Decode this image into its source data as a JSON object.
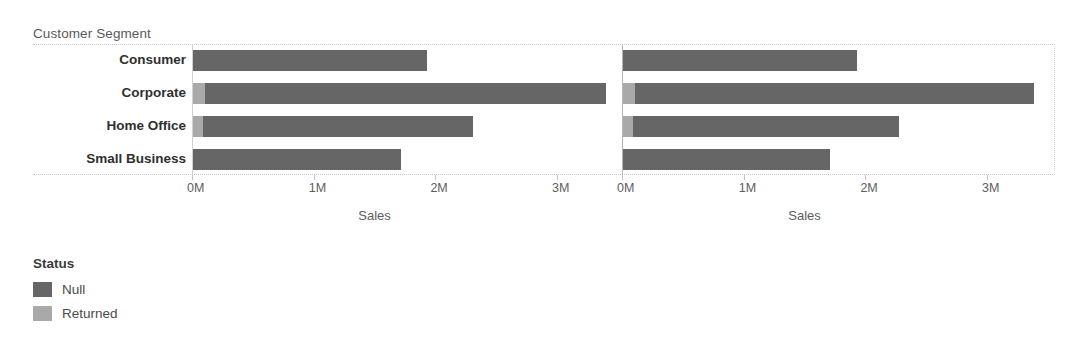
{
  "field_caption": "Customer Segment",
  "axis": {
    "title": "Sales",
    "ticks": [
      "0M",
      "1M",
      "2M",
      "3M"
    ],
    "tick_values": [
      0,
      1,
      2,
      3
    ],
    "min": 0,
    "max": 3.55
  },
  "legend": {
    "title": "Status",
    "items": [
      {
        "label": "Null",
        "color": "#666666"
      },
      {
        "label": "Returned",
        "color": "#a9a9a9"
      }
    ]
  },
  "colors": {
    "null_status": "#666666",
    "returned_status": "#a9a9a9",
    "grid": "#c8c8c8",
    "text": "#4a4a4a"
  },
  "chart_data": {
    "type": "bar",
    "orientation": "horizontal",
    "stacked": true,
    "title": "",
    "xlabel": "Sales",
    "ylabel": "Customer Segment",
    "xlim": [
      0,
      3.55
    ],
    "grid": false,
    "legend_position": "bottom-left",
    "categories": [
      "Consumer",
      "Corporate",
      "Home Office",
      "Small Business"
    ],
    "panels": [
      {
        "name": "panel-1",
        "series": [
          {
            "name": "Returned",
            "values": [
              0.0,
              0.1,
              0.08,
              0.0
            ]
          },
          {
            "name": "Null",
            "values": [
              1.92,
              3.29,
              2.22,
              1.71
            ]
          }
        ],
        "totals": [
          1.92,
          3.39,
          2.3,
          1.71
        ]
      },
      {
        "name": "panel-2",
        "series": [
          {
            "name": "Returned",
            "values": [
              0.0,
              0.1,
              0.08,
              0.0
            ]
          },
          {
            "name": "Null",
            "values": [
              1.92,
              3.28,
              2.19,
              1.7
            ]
          }
        ],
        "totals": [
          1.92,
          3.38,
          2.27,
          1.7
        ]
      }
    ]
  }
}
